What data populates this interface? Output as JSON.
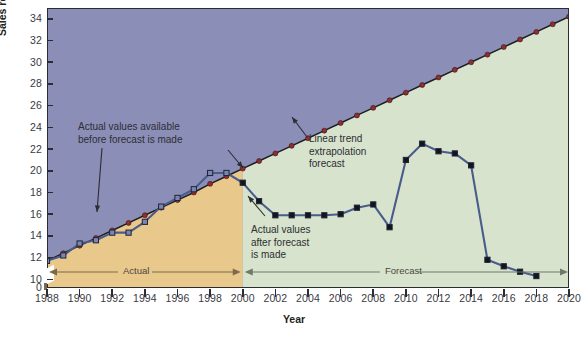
{
  "chart_data": {
    "type": "line",
    "title": "",
    "xlabel": "Year",
    "ylabel": "Sales revenue ($ billions)",
    "xlim": [
      1988,
      2020
    ],
    "ylim": [
      9.2,
      35.0
    ],
    "yticks": [
      10,
      12,
      14,
      16,
      18,
      20,
      22,
      24,
      26,
      28,
      30,
      32,
      34
    ],
    "ytick_labels": [
      "10",
      "12",
      "14",
      "16",
      "18",
      "20",
      "22",
      "24",
      "26",
      "28",
      "30",
      "32",
      "34"
    ],
    "zero_label": "0",
    "axis_break": true,
    "xticks": [
      1988,
      1990,
      1992,
      1994,
      1996,
      1998,
      2000,
      2002,
      2004,
      2006,
      2008,
      2010,
      2012,
      2014,
      2016,
      2018,
      2020
    ],
    "xtick_labels": [
      "1988",
      "1990",
      "1992",
      "1994",
      "1996",
      "1998",
      "2000",
      "2002",
      "2004",
      "2006",
      "2008",
      "2010",
      "2012",
      "2014",
      "2016",
      "2018",
      "2020"
    ],
    "grid": false,
    "legend_position": "none",
    "series": [
      {
        "name": "Actual values before forecast is made",
        "marker": "square",
        "color": "#4a5b8c",
        "x": [
          1988,
          1989,
          1990,
          1991,
          1992,
          1993,
          1994,
          1995,
          1996,
          1997,
          1998,
          1999
        ],
        "values": [
          11.7,
          12.2,
          13.3,
          13.6,
          14.3,
          14.3,
          15.3,
          16.7,
          17.5,
          18.3,
          19.8,
          19.8
        ]
      },
      {
        "name": "Actual values after forecast is made",
        "marker": "square",
        "color": "#4a5b8c",
        "x": [
          2000,
          2001,
          2002,
          2003,
          2004,
          2005,
          2006,
          2007,
          2008,
          2009,
          2010,
          2011,
          2012,
          2013,
          2014,
          2015,
          2016,
          2017,
          2018
        ],
        "values": [
          18.9,
          17.2,
          15.9,
          15.9,
          15.9,
          15.9,
          16.0,
          16.6,
          16.9,
          14.8,
          21.0,
          22.5,
          21.8,
          21.6,
          20.5,
          11.8,
          11.2,
          10.7,
          10.3
        ]
      },
      {
        "name": "Linear trend extrapolation forecast",
        "marker": "circle",
        "color": "#8c2f33",
        "x": [
          1988,
          1989,
          1990,
          1991,
          1992,
          1993,
          1994,
          1995,
          1996,
          1997,
          1998,
          1999,
          2000,
          2001,
          2002,
          2003,
          2004,
          2005,
          2006,
          2007,
          2008,
          2009,
          2010,
          2011,
          2012,
          2013,
          2014,
          2015,
          2016,
          2017,
          2018,
          2019,
          2020
        ],
        "values": [
          11.7,
          12.4,
          13.1,
          13.8,
          14.5,
          15.2,
          15.9,
          16.6,
          17.3,
          18.0,
          18.8,
          19.5,
          20.2,
          20.9,
          21.6,
          22.3,
          23.0,
          23.7,
          24.4,
          25.1,
          25.8,
          26.5,
          27.2,
          27.9,
          28.6,
          29.3,
          30.0,
          30.7,
          31.4,
          32.1,
          32.8,
          33.5,
          34.2
        ]
      }
    ],
    "regions": [
      {
        "name": "actual-region",
        "label": "Actual",
        "from": 1988,
        "to": 2000,
        "fill": "#e9c88b"
      },
      {
        "name": "forecast-region",
        "label": "Forecast",
        "from": 2000,
        "to": 2020,
        "fill": "#d7e3cc"
      }
    ],
    "background_fill": "#8b8fb8",
    "annotations": [
      {
        "name": "annotation-actual-before",
        "text": "Actual values available\nbefore forecast is made",
        "line1": "Actual values available",
        "line2": "before forecast is made"
      },
      {
        "name": "annotation-trend",
        "text": "Linear trend\nextrapolation\nforecast",
        "line1": "Linear trend",
        "line2": "extrapolation",
        "line3": "forecast"
      },
      {
        "name": "annotation-actual-after",
        "text": "Actual values\nafter forecast\nis made",
        "line1": "Actual values",
        "line2": "after forecast",
        "line3": "is made"
      }
    ]
  },
  "colors": {
    "actual_band": "#e9c88b",
    "forecast_band": "#d7e3cc",
    "upper_band": "#8b8fb8",
    "actual_line": "#4a5b8c",
    "trend_line": "#8c2f33",
    "axis": "#2b2b33"
  }
}
